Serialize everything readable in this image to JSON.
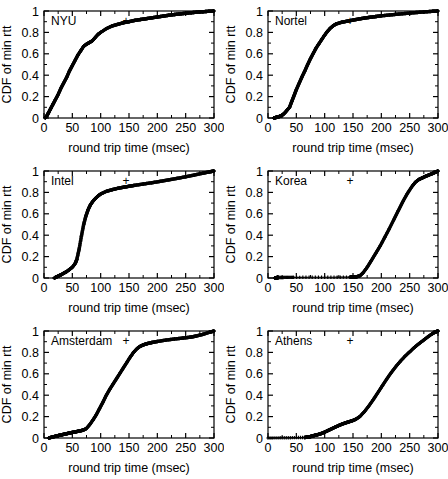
{
  "figure": {
    "panel_count": 6,
    "columns": 2,
    "rows": 3,
    "marker": "+",
    "marker_color": "#000000",
    "background": "#ffffff"
  },
  "axes": {
    "xlabel": "round trip time (msec)",
    "ylabel": "CDF of min rtt",
    "xlim": [
      0,
      300
    ],
    "ylim": [
      0,
      1
    ],
    "xticks": [
      0,
      50,
      100,
      150,
      200,
      250,
      300
    ],
    "xticklabels": [
      "0",
      "50",
      "100",
      "150",
      "200",
      "250",
      "300"
    ],
    "yticks": [
      0,
      0.2,
      0.4,
      0.6,
      0.8,
      1
    ],
    "yticklabels": [
      "0",
      "0.2",
      "0.4",
      "0.6",
      "0.8",
      "1"
    ],
    "minor_xticks": [
      25,
      75,
      125,
      175,
      225,
      275
    ],
    "minor_yticks": [
      0.1,
      0.3,
      0.5,
      0.7,
      0.9
    ],
    "grid": false,
    "frame": true
  },
  "chart_data": {
    "type": "line",
    "title": "",
    "xlabel": "round trip time (msec)",
    "ylabel": "CDF of min rtt",
    "xlim": [
      0,
      300
    ],
    "ylim": [
      0,
      1
    ],
    "legend_position": "inside-top-left",
    "panels": [
      {
        "label": "NYU",
        "legend_marker": "+",
        "x": [
          2,
          5,
          8,
          12,
          16,
          20,
          25,
          30,
          35,
          40,
          45,
          50,
          55,
          60,
          65,
          70,
          75,
          80,
          85,
          90,
          95,
          100,
          110,
          120,
          130,
          140,
          150,
          160,
          170,
          180,
          190,
          200,
          210,
          220,
          230,
          240,
          250,
          260,
          270,
          280,
          290,
          300
        ],
        "y": [
          0.0,
          0.02,
          0.05,
          0.09,
          0.13,
          0.17,
          0.22,
          0.28,
          0.33,
          0.38,
          0.44,
          0.49,
          0.54,
          0.59,
          0.63,
          0.67,
          0.69,
          0.705,
          0.72,
          0.75,
          0.78,
          0.8,
          0.835,
          0.86,
          0.875,
          0.89,
          0.9,
          0.912,
          0.92,
          0.928,
          0.936,
          0.944,
          0.952,
          0.96,
          0.967,
          0.973,
          0.979,
          0.984,
          0.989,
          0.993,
          0.997,
          1.0
        ]
      },
      {
        "label": "Nortel",
        "legend_marker": "+",
        "x": [
          10,
          14,
          18,
          22,
          26,
          30,
          34,
          38,
          42,
          46,
          50,
          55,
          60,
          65,
          70,
          75,
          80,
          85,
          90,
          95,
          100,
          105,
          110,
          115,
          120,
          130,
          140,
          150,
          160,
          170,
          180,
          190,
          200,
          215,
          230,
          245,
          260,
          275,
          290,
          300
        ],
        "y": [
          0.0,
          0.005,
          0.01,
          0.018,
          0.03,
          0.05,
          0.075,
          0.1,
          0.155,
          0.21,
          0.265,
          0.325,
          0.385,
          0.44,
          0.5,
          0.555,
          0.605,
          0.655,
          0.695,
          0.735,
          0.775,
          0.81,
          0.84,
          0.862,
          0.878,
          0.895,
          0.905,
          0.915,
          0.925,
          0.934,
          0.941,
          0.948,
          0.955,
          0.963,
          0.971,
          0.978,
          0.985,
          0.991,
          0.997,
          1.0
        ]
      },
      {
        "label": "Intel",
        "legend_marker": "+",
        "x": [
          18,
          22,
          26,
          30,
          35,
          40,
          45,
          50,
          55,
          58,
          62,
          66,
          70,
          74,
          78,
          82,
          86,
          90,
          95,
          100,
          110,
          120,
          130,
          140,
          150,
          160,
          175,
          190,
          205,
          220,
          235,
          250,
          265,
          280,
          292,
          300
        ],
        "y": [
          0.0,
          0.01,
          0.02,
          0.03,
          0.045,
          0.06,
          0.08,
          0.1,
          0.135,
          0.175,
          0.27,
          0.39,
          0.5,
          0.58,
          0.64,
          0.685,
          0.715,
          0.74,
          0.765,
          0.785,
          0.81,
          0.825,
          0.838,
          0.848,
          0.857,
          0.866,
          0.878,
          0.89,
          0.903,
          0.917,
          0.931,
          0.946,
          0.962,
          0.979,
          0.992,
          1.0
        ]
      },
      {
        "label": "Korea",
        "legend_marker": "+",
        "x": [
          12,
          14,
          16,
          18,
          45,
          145,
          150,
          155,
          162,
          168,
          175,
          182,
          190,
          198,
          206,
          214,
          222,
          230,
          238,
          246,
          254,
          260,
          266,
          272,
          278,
          284,
          290,
          295,
          300
        ],
        "y": [
          0.002,
          0.003,
          0.004,
          0.005,
          0.006,
          0.008,
          0.009,
          0.01,
          0.02,
          0.05,
          0.1,
          0.16,
          0.23,
          0.3,
          0.38,
          0.46,
          0.545,
          0.63,
          0.715,
          0.79,
          0.855,
          0.895,
          0.92,
          0.935,
          0.95,
          0.963,
          0.976,
          0.988,
          1.0
        ]
      },
      {
        "label": "Amsterdam",
        "legend_marker": "+",
        "x": [
          8,
          14,
          20,
          26,
          32,
          38,
          44,
          50,
          56,
          62,
          68,
          74,
          80,
          86,
          92,
          98,
          104,
          110,
          116,
          122,
          128,
          134,
          140,
          146,
          152,
          158,
          164,
          170,
          176,
          182,
          190,
          200,
          215,
          230,
          245,
          258,
          268,
          280,
          292,
          300
        ],
        "y": [
          0.0,
          0.008,
          0.016,
          0.024,
          0.031,
          0.038,
          0.045,
          0.052,
          0.058,
          0.065,
          0.072,
          0.085,
          0.12,
          0.165,
          0.215,
          0.275,
          0.335,
          0.4,
          0.455,
          0.505,
          0.555,
          0.605,
          0.655,
          0.705,
          0.755,
          0.8,
          0.835,
          0.858,
          0.872,
          0.882,
          0.892,
          0.902,
          0.915,
          0.925,
          0.934,
          0.942,
          0.952,
          0.968,
          0.988,
          1.0
        ]
      },
      {
        "label": "Athens",
        "legend_marker": "+",
        "x": [
          0,
          65,
          70,
          74,
          78,
          82,
          88,
          94,
          100,
          106,
          112,
          118,
          124,
          130,
          136,
          142,
          148,
          155,
          162,
          170,
          178,
          186,
          194,
          202,
          210,
          218,
          226,
          234,
          242,
          250,
          258,
          266,
          274,
          282,
          290,
          296,
          300
        ],
        "y": [
          0.0,
          0.005,
          0.008,
          0.012,
          0.018,
          0.024,
          0.032,
          0.042,
          0.055,
          0.07,
          0.085,
          0.1,
          0.115,
          0.128,
          0.14,
          0.15,
          0.16,
          0.175,
          0.2,
          0.245,
          0.3,
          0.36,
          0.425,
          0.49,
          0.555,
          0.615,
          0.67,
          0.72,
          0.765,
          0.805,
          0.845,
          0.88,
          0.912,
          0.945,
          0.975,
          0.992,
          1.0
        ]
      }
    ]
  }
}
